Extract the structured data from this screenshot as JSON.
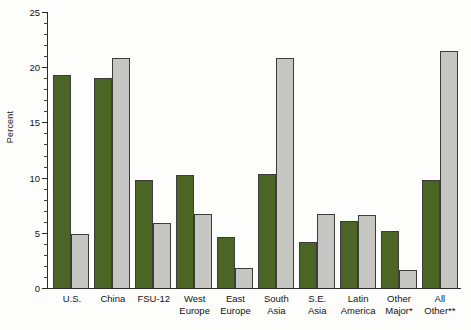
{
  "chart_data": {
    "type": "bar",
    "title": "",
    "xlabel": "",
    "ylabel": "Percent",
    "ylim": [
      0,
      25
    ],
    "ytick_step_major": 5,
    "ytick_step_minor": 1,
    "ytick_labels": [
      "0",
      "5",
      "10",
      "15",
      "20",
      "25"
    ],
    "grid": false,
    "legend": "none",
    "categories": [
      "U.S.",
      "China",
      "FSU-12",
      "West\nEurope",
      "East\nEurope",
      "South\nAsia",
      "S.E.\nAsia",
      "Latin\nAmerica",
      "Other\nMajor*",
      "All\nOther**"
    ],
    "series": [
      {
        "name": "series-green",
        "color": "#4b6524",
        "values": [
          19.3,
          19.0,
          9.8,
          10.2,
          4.6,
          10.3,
          4.2,
          6.1,
          5.2,
          9.8
        ]
      },
      {
        "name": "series-gray",
        "color": "#c6c6c2",
        "values": [
          4.9,
          20.8,
          5.9,
          6.7,
          1.8,
          20.8,
          6.7,
          6.6,
          1.6,
          21.5
        ]
      }
    ]
  }
}
